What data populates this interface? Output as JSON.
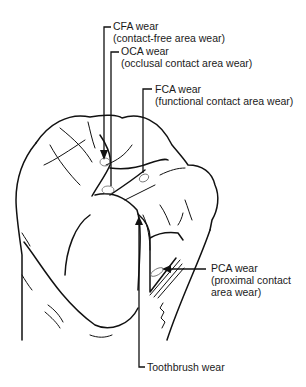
{
  "figure": {
    "type": "annotated-illustration",
    "labels": [
      {
        "id": "cfa",
        "title": "CFA wear",
        "subtitle": "(contact-free area wear)"
      },
      {
        "id": "oca",
        "title": "OCA wear",
        "subtitle": "(occlusal contact area wear)"
      },
      {
        "id": "fca",
        "title": "FCA wear",
        "subtitle": "(functional contact area wear)"
      },
      {
        "id": "pca",
        "title": "PCA wear",
        "subtitle_line1": "(proximal contact",
        "subtitle_line2": "area wear)"
      },
      {
        "id": "toothbrush",
        "title": "Toothbrush wear"
      }
    ]
  }
}
